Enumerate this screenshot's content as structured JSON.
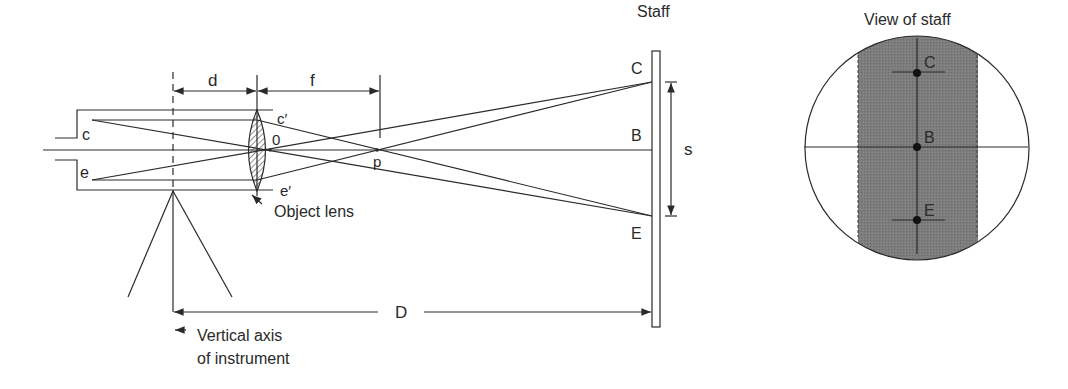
{
  "figure": {
    "left_diagram": {
      "labels": {
        "d": "d",
        "f": "f",
        "c": "c",
        "e": "e",
        "c_prime": "c′",
        "e_prime": "e′",
        "o": "0",
        "p": "p",
        "staff": "Staff",
        "C": "C",
        "B": "B",
        "E": "E",
        "s": "s",
        "D": "D",
        "object_lens": "Object lens",
        "vertical_axis_line1": "Vertical axis",
        "vertical_axis_line2": "of instrument"
      }
    },
    "right_diagram": {
      "title": "View of staff",
      "labels": {
        "C": "C",
        "B": "B",
        "E": "E"
      },
      "colors": {
        "staff_fill": "#7a7a7a",
        "outline": "#2a2a2a"
      }
    }
  }
}
